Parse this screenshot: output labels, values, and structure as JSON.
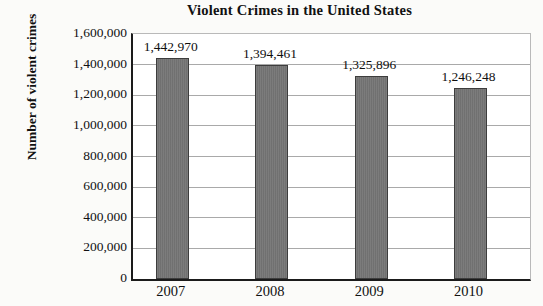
{
  "chart_data": {
    "type": "bar",
    "title": "Violent Crimes in the United States",
    "xlabel": "",
    "ylabel": "Number of violent crimes",
    "categories": [
      "2007",
      "2008",
      "2009",
      "2010"
    ],
    "values": [
      1442970,
      1394461,
      1325896,
      1246248
    ],
    "data_labels": [
      "1,442,970",
      "1,394,461",
      "1,325,896",
      "1,246,248"
    ],
    "ylim": [
      0,
      1600000
    ],
    "ytick_step": 200000,
    "ytick_labels": [
      "1,600,000",
      "1,400,000",
      "1,200,000",
      "1,000,000",
      "800,000",
      "600,000",
      "400,000",
      "200,000",
      "0"
    ],
    "grid": "horizontal",
    "legend": "none",
    "bar_color": "#757575",
    "bar_border_color": "#3d3d3d",
    "gridline_color": "#a9a9a9",
    "axis_color": "#1b1b1b",
    "text_color": "#111111",
    "plot_background": "#ffffff",
    "figure_background": "#fbfbf9"
  }
}
